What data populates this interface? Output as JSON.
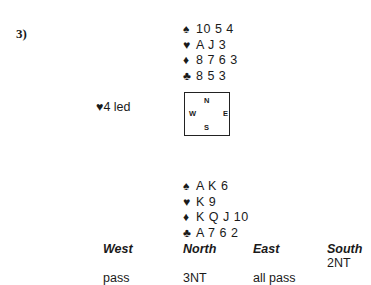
{
  "problem_number": "3)",
  "north": {
    "spades": "10 5 4",
    "hearts": "A J 3",
    "diamonds": "8 7 6 3",
    "clubs": "8 5 3"
  },
  "south": {
    "spades": "A K 6",
    "hearts": "K 9",
    "diamonds": "K Q J 10",
    "clubs": "A 7 6 2"
  },
  "suit_symbols": {
    "spades": "♠",
    "hearts": "♥",
    "diamonds": "♦",
    "clubs": "♣"
  },
  "opening_lead": "♥4 led",
  "compass": {
    "n": "N",
    "s": "S",
    "w": "W",
    "e": "E"
  },
  "auction": {
    "headers": [
      "West",
      "North",
      "East",
      "South"
    ],
    "rows": [
      [
        "",
        "",
        "",
        "2NT"
      ],
      [
        "pass",
        "3NT",
        "all pass",
        ""
      ]
    ]
  }
}
